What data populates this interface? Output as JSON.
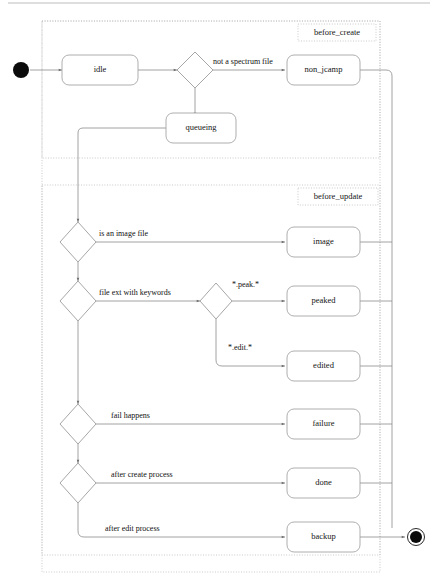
{
  "diagram": {
    "type": "uml-state-diagram",
    "colors": {
      "stroke": "#8f8f8f",
      "region_stroke": "#bdbdbd",
      "text": "#151515",
      "node_fill": "#ffffff",
      "terminal_fill": "#0b0b0b",
      "page_bg": "#ffffff"
    },
    "regions": [
      {
        "id": "before_create",
        "label": "before_create"
      },
      {
        "id": "before_update",
        "label": "before_update"
      }
    ],
    "states": [
      {
        "id": "idle",
        "label": "idle"
      },
      {
        "id": "non_jcamp",
        "label": "non_jcamp"
      },
      {
        "id": "queueing",
        "label": "queueing"
      },
      {
        "id": "image",
        "label": "image"
      },
      {
        "id": "peaked",
        "label": "peaked"
      },
      {
        "id": "edited",
        "label": "edited"
      },
      {
        "id": "failure",
        "label": "failure"
      },
      {
        "id": "done",
        "label": "done"
      },
      {
        "id": "backup",
        "label": "backup"
      }
    ],
    "terminals": [
      {
        "id": "start",
        "kind": "initial-node"
      },
      {
        "id": "end",
        "kind": "final-node"
      }
    ],
    "decisions": [
      {
        "id": "d1",
        "kind": "choice-diamond"
      },
      {
        "id": "d2",
        "kind": "choice-diamond"
      },
      {
        "id": "d3",
        "kind": "choice-diamond"
      },
      {
        "id": "d4",
        "kind": "choice-diamond"
      },
      {
        "id": "d5",
        "kind": "choice-diamond"
      },
      {
        "id": "d6",
        "kind": "choice-diamond"
      }
    ],
    "transitions": [
      {
        "from": "start",
        "to": "idle",
        "label": ""
      },
      {
        "from": "idle",
        "to": "d1",
        "label": ""
      },
      {
        "from": "d1",
        "to": "non_jcamp",
        "label": "not a spectrum file"
      },
      {
        "from": "d1",
        "to": "queueing",
        "label": ""
      },
      {
        "from": "queueing",
        "to": "d2",
        "label": ""
      },
      {
        "from": "d2",
        "to": "image",
        "label": "is an image file"
      },
      {
        "from": "d2",
        "to": "d3",
        "label": ""
      },
      {
        "from": "d3",
        "to": "d4",
        "label": "file ext with keywords"
      },
      {
        "from": "d4",
        "to": "peaked",
        "label": "*.peak.*"
      },
      {
        "from": "d4",
        "to": "edited",
        "label": "*.edit.*"
      },
      {
        "from": "d3",
        "to": "d5",
        "label": ""
      },
      {
        "from": "d5",
        "to": "failure",
        "label": "fail happens"
      },
      {
        "from": "d5",
        "to": "d6",
        "label": ""
      },
      {
        "from": "d6",
        "to": "done",
        "label": "after create process"
      },
      {
        "from": "d6",
        "to": "backup",
        "label": "after edit process"
      },
      {
        "from": "backup",
        "to": "end",
        "label": ""
      }
    ],
    "edge_labels": {
      "not_a_spectrum_file": "not a spectrum file",
      "is_an_image_file": "is an image file",
      "file_ext_with_keywords": "file ext with keywords",
      "peak_glob": "*.peak.*",
      "edit_glob": "*.edit.*",
      "fail_happens": "fail happens",
      "after_create_process": "after create process",
      "after_edit_process": "after edit process"
    }
  }
}
